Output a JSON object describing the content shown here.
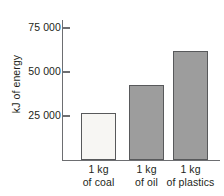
{
  "chart_data": {
    "type": "bar",
    "title": "",
    "subtitle": "",
    "xlabel": "",
    "ylabel": "kJ of energy",
    "categories": [
      "1 kg of coal",
      "1 kg of oil",
      "1 kg of plastics"
    ],
    "category_lines": [
      [
        "1 kg",
        "of coal"
      ],
      [
        "1 kg",
        "of oil"
      ],
      [
        "1 kg",
        "of plastics"
      ]
    ],
    "values": [
      27500,
      44000,
      64000
    ],
    "ylim": [
      0,
      82000
    ],
    "yticks": [
      25000,
      50000,
      75000
    ],
    "ytick_labels": [
      "25 000",
      "50 000",
      "75 000"
    ],
    "grid": false,
    "legend": false,
    "bar_colors": [
      "#f7f6f3",
      "#9d9d9d",
      "#9d9d9d"
    ],
    "bar_border_color": "#58595b",
    "axis_color": "#6d6e71",
    "text_color": "#231f20"
  }
}
